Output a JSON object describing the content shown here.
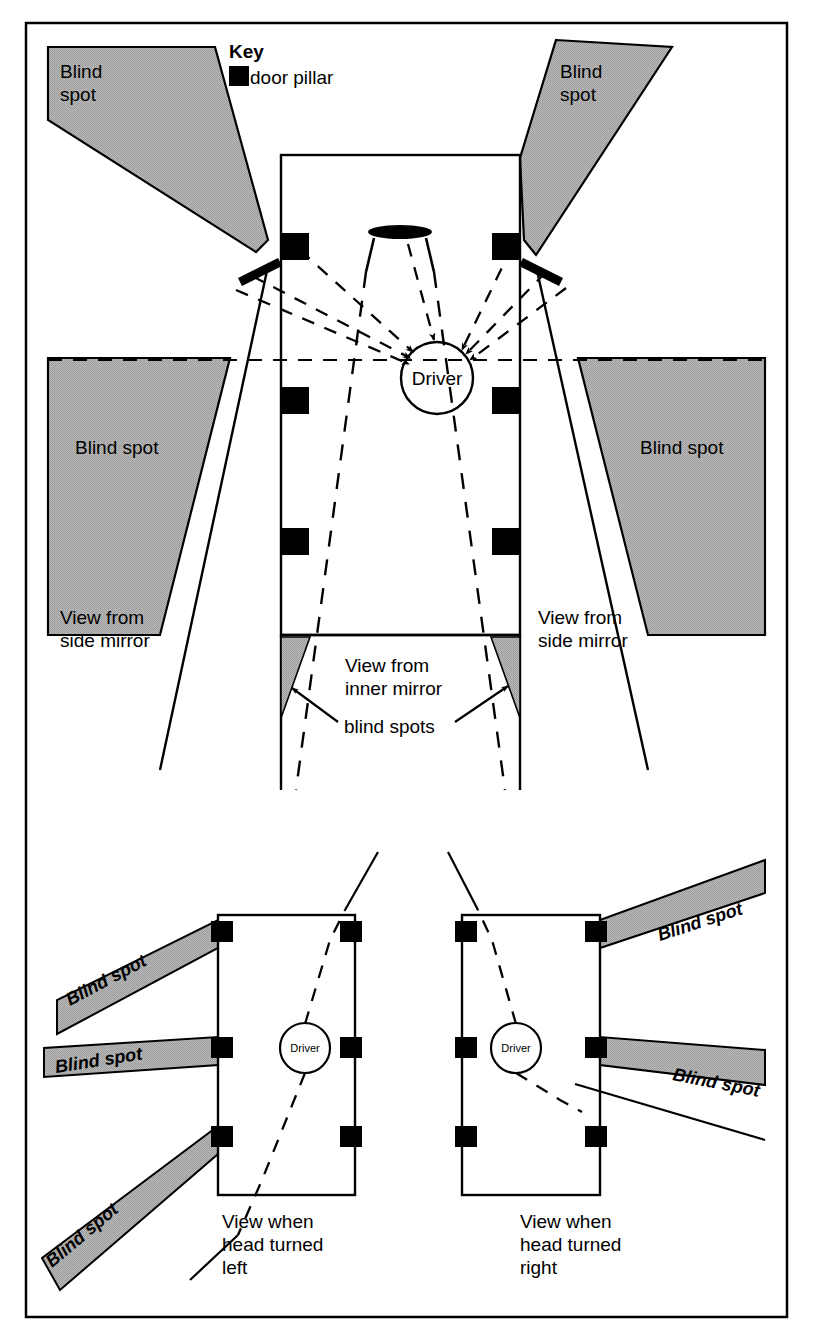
{
  "figure": {
    "type": "technical-diagram",
    "background_color": "#ffffff",
    "line_color": "#000000",
    "blind_spot_fill": "#adadad"
  },
  "key": {
    "title": "Key",
    "swatch_label": "door pillar",
    "swatch_color": "#000000"
  },
  "main_view": {
    "driver_label": "Driver",
    "blind_spot_front_left": "Blind\nspot",
    "blind_spot_front_left_line1": "Blind",
    "blind_spot_front_left_line2": "spot",
    "blind_spot_front_right_line1": "Blind",
    "blind_spot_front_right_line2": "spot",
    "blind_spot_side_left": "Blind spot",
    "blind_spot_side_right": "Blind spot",
    "view_side_mirror_left_line1": "View from",
    "view_side_mirror_left_line2": "side mirror",
    "view_side_mirror_right_line1": "View from",
    "view_side_mirror_right_line2": "side mirror",
    "view_inner_mirror_line1": "View from",
    "view_inner_mirror_line2": "inner mirror",
    "blind_spots_rear_label": "blind spots"
  },
  "head_left_view": {
    "caption_line1": "View when",
    "caption_line2": "head turned",
    "caption_line3": "left",
    "driver_label": "Driver",
    "bands": [
      {
        "label": "Blind spot"
      },
      {
        "label": "Blind spot"
      },
      {
        "label": "Blind spot"
      }
    ]
  },
  "head_right_view": {
    "caption_line1": "View when",
    "caption_line2": "head turned",
    "caption_line3": "right",
    "driver_label": "Driver",
    "bands": [
      {
        "label": "Blind spot"
      },
      {
        "label": "Blind spot"
      }
    ]
  }
}
